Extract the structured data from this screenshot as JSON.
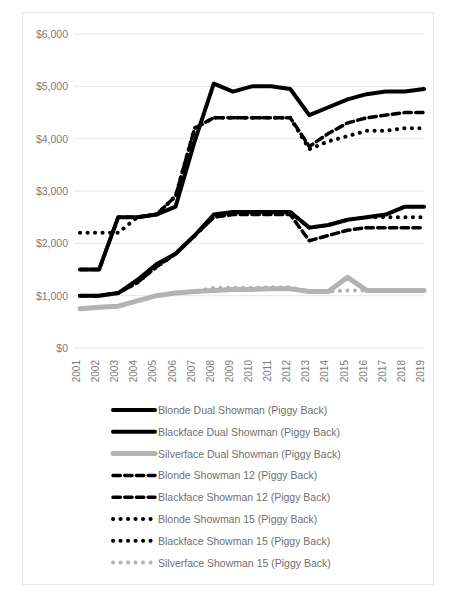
{
  "chart_data": {
    "type": "line",
    "title": "",
    "xlabel": "",
    "ylabel": "",
    "grid": true,
    "legend_position": "bottom",
    "ylim": [
      0,
      6000
    ],
    "ytick_labels": [
      "$6,000",
      "$5,000",
      "$4,000",
      "$3,000",
      "$2,000",
      "$1,000",
      "$0"
    ],
    "ytick_values": [
      6000,
      5000,
      4000,
      3000,
      2000,
      1000,
      0
    ],
    "categories": [
      "2001",
      "2002",
      "2003",
      "2004",
      "2005",
      "2006",
      "2007",
      "2008",
      "2009",
      "2010",
      "2011",
      "2012",
      "2013",
      "2014",
      "2015",
      "2016",
      "2017",
      "2018",
      "2019"
    ],
    "series": [
      {
        "name": "Blonde Dual Showman (Piggy Back)",
        "style": "solid",
        "color": "#000000",
        "width": 4,
        "values": [
          1500,
          1500,
          2500,
          2500,
          2550,
          2700,
          3950,
          5050,
          4900,
          5000,
          5000,
          4950,
          4450,
          4600,
          4750,
          4850,
          4900,
          4900,
          4950
        ]
      },
      {
        "name": "Blackface Dual Showman (Piggy Back)",
        "style": "solid",
        "color": "#000000",
        "width": 4,
        "values": [
          1000,
          1000,
          1050,
          1300,
          1600,
          1800,
          2150,
          2550,
          2600,
          2600,
          2600,
          2600,
          2300,
          2350,
          2450,
          2500,
          2550,
          2700,
          2700
        ]
      },
      {
        "name": "Silverface Dual Showman (Piggy Back)",
        "style": "solid",
        "color": "#b3b3b3",
        "width": 5,
        "values": [
          750,
          780,
          800,
          900,
          1000,
          1050,
          1080,
          1100,
          1120,
          1120,
          1130,
          1130,
          1080,
          1080,
          1350,
          1100,
          1100,
          1100,
          1100
        ]
      },
      {
        "name": "Blonde Showman 12 (Piggy Back)",
        "style": "dashed",
        "color": "#000000",
        "width": 3.5,
        "values": [
          1500,
          1500,
          2500,
          2500,
          2550,
          2900,
          4200,
          4400,
          4400,
          4400,
          4400,
          4400,
          3850,
          4100,
          4300,
          4400,
          4450,
          4500,
          4500
        ]
      },
      {
        "name": "Blackface Showman 12 (Piggy Back)",
        "style": "dashed",
        "color": "#000000",
        "width": 3.5,
        "values": [
          1000,
          1000,
          1050,
          1250,
          1550,
          1800,
          2150,
          2500,
          2550,
          2550,
          2550,
          2550,
          2050,
          2150,
          2250,
          2300,
          2300,
          2300,
          2300
        ]
      },
      {
        "name": "Blonde Showman 15 (Piggy Back)",
        "style": "dotted",
        "color": "#000000",
        "width": 4,
        "values": [
          2200,
          2200,
          2200,
          2500,
          2550,
          2900,
          4200,
          4400,
          4400,
          4400,
          4400,
          4400,
          3800,
          3950,
          4050,
          4150,
          4150,
          4200,
          4200
        ]
      },
      {
        "name": "Blackface Showman 15 (Piggy Back)",
        "style": "dotted",
        "color": "#000000",
        "width": 4,
        "values": [
          1000,
          1000,
          1050,
          1250,
          1550,
          1800,
          2150,
          2500,
          2600,
          2600,
          2600,
          2600,
          2300,
          2350,
          2450,
          2500,
          2500,
          2500,
          2500
        ]
      },
      {
        "name": "Silverface Showman 15 (Piggy Back)",
        "style": "dotted",
        "color": "#b3b3b3",
        "width": 4,
        "values": [
          750,
          780,
          800,
          900,
          1000,
          1050,
          1080,
          1150,
          1150,
          1150,
          1160,
          1160,
          1080,
          1080,
          1100,
          1100,
          1100,
          1100,
          1100
        ]
      }
    ]
  },
  "legend": {
    "items": [
      {
        "label": "Blonde Dual Showman (Piggy Back)"
      },
      {
        "label": "Blackface Dual Showman (Piggy Back)"
      },
      {
        "label": "Silverface Dual Showman (Piggy Back)"
      },
      {
        "label": "Blonde Showman 12 (Piggy Back)"
      },
      {
        "label": "Blackface Showman 12 (Piggy Back)"
      },
      {
        "label": "Blonde Showman 15 (Piggy Back)"
      },
      {
        "label": "Blackface Showman 15 (Piggy Back)"
      },
      {
        "label": "Silverface Showman 15 (Piggy Back)"
      }
    ]
  }
}
